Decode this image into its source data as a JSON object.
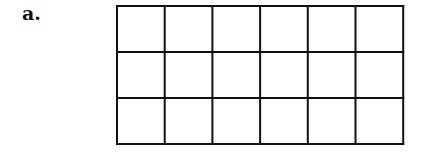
{
  "figure": {
    "label": "a.",
    "grid": {
      "rows": 3,
      "columns": 6,
      "cell_width": 47.7,
      "cell_height": 46,
      "line_color": "#111111",
      "line_width": 2,
      "total_cells": 18
    }
  }
}
